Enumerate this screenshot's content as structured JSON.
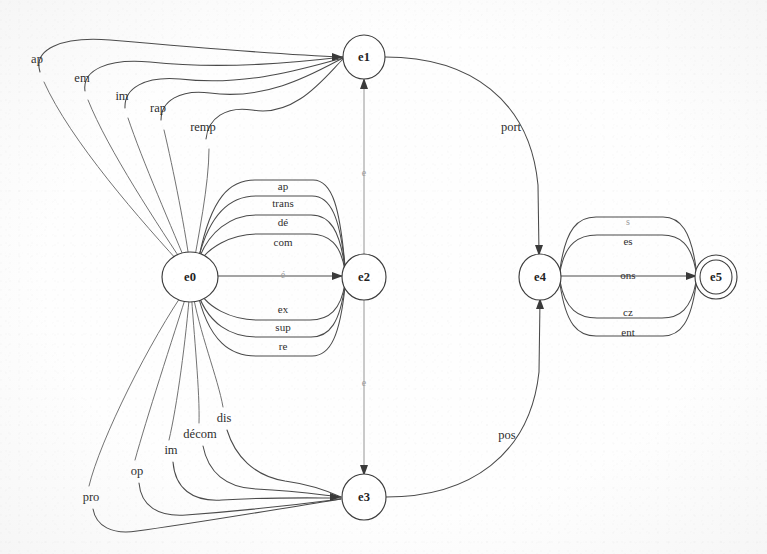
{
  "diagram": {
    "type": "state-transition-diagram",
    "background_color": "#fefefe",
    "stroke_color": "#3d3d3d",
    "states": [
      {
        "id": "e0",
        "label": "e0",
        "cx": 190,
        "cy": 277,
        "r": 24,
        "accepting": false
      },
      {
        "id": "e1",
        "label": "e1",
        "cx": 364,
        "cy": 57,
        "r": 21,
        "accepting": false
      },
      {
        "id": "e2",
        "label": "e2",
        "cx": 364,
        "cy": 277,
        "r": 22,
        "accepting": false
      },
      {
        "id": "e3",
        "label": "e3",
        "cx": 364,
        "cy": 497,
        "r": 22,
        "accepting": false
      },
      {
        "id": "e4",
        "label": "e4",
        "cx": 540,
        "cy": 277,
        "r": 21,
        "accepting": false
      },
      {
        "id": "e5",
        "label": "e5",
        "cx": 716,
        "cy": 277,
        "r": 17,
        "accepting": true
      }
    ],
    "transitions_e0_to_e1": [
      {
        "label": "ap",
        "label_x": 37,
        "label_y": 59
      },
      {
        "label": "em",
        "label_x": 82,
        "label_y": 78
      },
      {
        "label": "im",
        "label_x": 122,
        "label_y": 96
      },
      {
        "label": "rap",
        "label_x": 158,
        "label_y": 108
      },
      {
        "label": "remp",
        "label_x": 203,
        "label_y": 127
      }
    ],
    "transitions_e0_to_e2": [
      {
        "label": "ap",
        "label_x": 283,
        "label_y": 186
      },
      {
        "label": "trans",
        "label_x": 283,
        "label_y": 202
      },
      {
        "label": "dé",
        "label_x": 283,
        "label_y": 222
      },
      {
        "label": "com",
        "label_x": 283,
        "label_y": 242
      },
      {
        "label": "é",
        "label_x": 283,
        "label_y": 275
      },
      {
        "label": "ex",
        "label_x": 283,
        "label_y": 309
      },
      {
        "label": "sup",
        "label_x": 283,
        "label_y": 326
      },
      {
        "label": "re",
        "label_x": 283,
        "label_y": 346
      }
    ],
    "transitions_e0_to_e3": [
      {
        "label": "pro",
        "label_x": 91,
        "label_y": 497
      },
      {
        "label": "op",
        "label_x": 137,
        "label_y": 471
      },
      {
        "label": "im",
        "label_x": 171,
        "label_y": 450
      },
      {
        "label": "décom",
        "label_x": 200,
        "label_y": 434
      },
      {
        "label": "dis",
        "label_x": 224,
        "label_y": 418
      }
    ],
    "transitions_e4_to_e5": [
      {
        "label": "s",
        "label_x": 628,
        "label_y": 222
      },
      {
        "label": "es",
        "label_x": 628,
        "label_y": 241
      },
      {
        "label": "ons",
        "label_x": 628,
        "label_y": 275
      },
      {
        "label": "cz",
        "label_x": 628,
        "label_y": 312
      },
      {
        "label": "ent",
        "label_x": 628,
        "label_y": 331
      }
    ],
    "transitions_vertical": [
      {
        "from": "e2",
        "to": "e1",
        "label": "e",
        "label_x": 364,
        "label_y": 172
      },
      {
        "from": "e2",
        "to": "e3",
        "label": "e",
        "label_x": 364,
        "label_y": 382
      }
    ],
    "transitions_outer": [
      {
        "from": "e1",
        "to": "e4",
        "label": "port",
        "label_x": 511,
        "label_y": 127
      },
      {
        "from": "e3",
        "to": "e4",
        "label": "pos",
        "label_x": 507,
        "label_y": 435
      }
    ]
  }
}
